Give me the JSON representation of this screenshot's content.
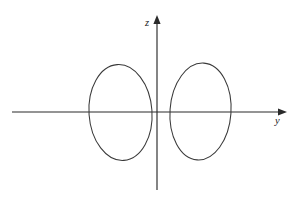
{
  "figure": {
    "background_color": "#ffffff",
    "stroke_color": "#3a3a3a",
    "axis_color": "#2a2a2a",
    "width": 296,
    "height": 200
  },
  "axes": {
    "horizontal": {
      "label": "y",
      "name": "y-axis",
      "x_start": 12,
      "x_end": 287,
      "y": 112,
      "arrow": "right",
      "label_x": 275,
      "label_y": 124
    },
    "vertical": {
      "label": "z",
      "name": "z-axis",
      "x": 157,
      "y_start": 190,
      "y_end": 15,
      "arrow": "up",
      "label_x": 145,
      "label_y": 26
    },
    "origin": {
      "x": 157,
      "y": 112
    }
  },
  "chart_data": {
    "type": "line",
    "title": "",
    "xlabel": "y",
    "ylabel": "z",
    "grid": false,
    "legend": null,
    "axis_ranges": {
      "x": [
        12,
        287
      ],
      "y": [
        190,
        15
      ]
    },
    "series": [
      {
        "name": "left-ellipse",
        "shape": "ellipse",
        "center": {
          "x": 120.5,
          "y": 112.5
        },
        "radius_x": 31.5,
        "radius_y": 48.0,
        "rotation_deg": -4,
        "x_extent": [
          88,
          152
        ],
        "y_extent": [
          65,
          160
        ]
      },
      {
        "name": "right-ellipse",
        "shape": "ellipse",
        "center": {
          "x": 200.5,
          "y": 111.5
        },
        "radius_x": 30.5,
        "radius_y": 48.5,
        "rotation_deg": 4,
        "x_extent": [
          170,
          232
        ],
        "y_extent": [
          63,
          160
        ]
      }
    ]
  }
}
